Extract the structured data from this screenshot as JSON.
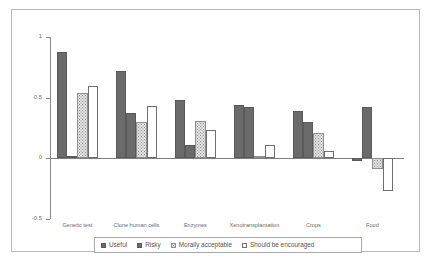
{
  "chart_data": {
    "type": "bar",
    "title": "",
    "subtitle": "",
    "xlabel": "",
    "ylabel": "",
    "ylim": [
      -0.5,
      1
    ],
    "yticks": [
      1,
      0.5,
      0,
      -0.5
    ],
    "ytick_labels": [
      "1",
      "0.5",
      "0",
      "-0.5"
    ],
    "grid": false,
    "legend_position": "bottom",
    "categories": [
      "Genetic test",
      "Clone human cells",
      "Enzymes",
      "Xenotransplantation",
      "Crops",
      "Food"
    ],
    "series": [
      {
        "name": "Useful",
        "swatch": "#6b6b6b",
        "style": "solid-dark",
        "values": [
          0.88,
          0.72,
          0.48,
          0.44,
          0.39,
          -0.02
        ]
      },
      {
        "name": "Risky",
        "swatch": "#6b6b6b",
        "style": "solid-dark",
        "values": [
          0.02,
          0.37,
          0.11,
          0.42,
          0.3,
          0.42
        ]
      },
      {
        "name": "Morally acceptable",
        "swatch": "#e3e3e3",
        "style": "dotted-light",
        "values": [
          0.54,
          0.3,
          0.31,
          0.02,
          0.21,
          -0.09
        ]
      },
      {
        "name": "Should be encouraged",
        "swatch": "#ffffff",
        "style": "outline-white",
        "values": [
          0.6,
          0.43,
          0.23,
          0.11,
          0.06,
          -0.27
        ]
      }
    ]
  },
  "legend": {
    "items": [
      {
        "label": "Useful"
      },
      {
        "label": "Risky"
      },
      {
        "label": "Morally acceptable"
      },
      {
        "label": "Should be encouraged"
      }
    ]
  }
}
